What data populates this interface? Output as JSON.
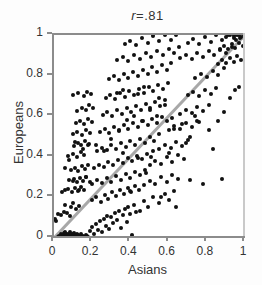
{
  "chart_data": {
    "type": "scatter",
    "correlation_label": "r",
    "correlation_operator": "=",
    "correlation_value": ".81",
    "xlabel": "Asians",
    "ylabel": "Europeans",
    "xlim": [
      0,
      1
    ],
    "ylim": [
      0,
      1
    ],
    "grid": false,
    "legend": null,
    "xticks": [
      "0",
      "0.2",
      "0.4",
      "0.6",
      "0.8",
      "1"
    ],
    "xtick_values": [
      0,
      0.2,
      0.4,
      0.6,
      0.8,
      1
    ],
    "yticks": [
      "0",
      "0.2",
      "0.4",
      "0.6",
      "0.8",
      "1"
    ],
    "ytick_values": [
      0,
      0.2,
      0.4,
      0.6,
      0.8,
      1
    ],
    "reference_line": {
      "name": "identity-line",
      "from": [
        0,
        0
      ],
      "to": [
        1,
        1
      ],
      "color": "#a8a8a8",
      "width": 3
    },
    "marker": {
      "shape": "circle",
      "color": "#111111",
      "size_px": 4
    },
    "axis_color": "#8c8c8c",
    "background": "#ffffff",
    "points": [
      [
        0.005,
        0.095
      ],
      [
        0.012,
        0.085
      ],
      [
        0.02,
        0.005
      ],
      [
        0.025,
        0.012
      ],
      [
        0.03,
        0.002
      ],
      [
        0.035,
        0.02
      ],
      [
        0.04,
        0.008
      ],
      [
        0.042,
        0.0
      ],
      [
        0.045,
        0.015
      ],
      [
        0.05,
        0.005
      ],
      [
        0.052,
        0.025
      ],
      [
        0.055,
        0.0
      ],
      [
        0.058,
        0.01
      ],
      [
        0.06,
        0.03
      ],
      [
        0.062,
        0.005
      ],
      [
        0.065,
        0.018
      ],
      [
        0.068,
        0.0
      ],
      [
        0.07,
        0.008
      ],
      [
        0.072,
        0.022
      ],
      [
        0.075,
        0.002
      ],
      [
        0.078,
        0.012
      ],
      [
        0.08,
        0.0
      ],
      [
        0.082,
        0.028
      ],
      [
        0.085,
        0.006
      ],
      [
        0.088,
        0.015
      ],
      [
        0.09,
        0.0
      ],
      [
        0.092,
        0.01
      ],
      [
        0.095,
        0.02
      ],
      [
        0.098,
        0.004
      ],
      [
        0.1,
        0.013
      ],
      [
        0.103,
        0.0
      ],
      [
        0.105,
        0.026
      ],
      [
        0.108,
        0.008
      ],
      [
        0.11,
        0.017
      ],
      [
        0.112,
        0.0
      ],
      [
        0.115,
        0.01
      ],
      [
        0.118,
        0.022
      ],
      [
        0.12,
        0.003
      ],
      [
        0.125,
        0.014
      ],
      [
        0.13,
        0.0
      ],
      [
        0.135,
        0.009
      ],
      [
        0.14,
        0.019
      ],
      [
        0.145,
        0.002
      ],
      [
        0.15,
        0.012
      ],
      [
        0.155,
        0.0
      ],
      [
        0.16,
        0.007
      ],
      [
        0.165,
        0.016
      ],
      [
        0.17,
        0.0
      ],
      [
        0.175,
        0.011
      ],
      [
        0.18,
        0.004
      ],
      [
        0.02,
        0.118
      ],
      [
        0.035,
        0.115
      ],
      [
        0.05,
        0.13
      ],
      [
        0.07,
        0.125
      ],
      [
        0.085,
        0.108
      ],
      [
        0.06,
        0.165
      ],
      [
        0.09,
        0.155
      ],
      [
        0.1,
        0.17
      ],
      [
        0.115,
        0.145
      ],
      [
        0.13,
        0.158
      ],
      [
        0.04,
        0.225
      ],
      [
        0.055,
        0.235
      ],
      [
        0.075,
        0.24
      ],
      [
        0.095,
        0.228
      ],
      [
        0.11,
        0.245
      ],
      [
        0.125,
        0.232
      ],
      [
        0.14,
        0.25
      ],
      [
        0.155,
        0.238
      ],
      [
        0.08,
        0.285
      ],
      [
        0.105,
        0.29
      ],
      [
        0.12,
        0.275
      ],
      [
        0.135,
        0.295
      ],
      [
        0.15,
        0.282
      ],
      [
        0.165,
        0.3
      ],
      [
        0.09,
        0.335
      ],
      [
        0.112,
        0.345
      ],
      [
        0.128,
        0.33
      ],
      [
        0.145,
        0.355
      ],
      [
        0.16,
        0.34
      ],
      [
        0.178,
        0.36
      ],
      [
        0.075,
        0.405
      ],
      [
        0.098,
        0.415
      ],
      [
        0.118,
        0.4
      ],
      [
        0.14,
        0.425
      ],
      [
        0.158,
        0.41
      ],
      [
        0.105,
        0.455
      ],
      [
        0.125,
        0.47
      ],
      [
        0.142,
        0.46
      ],
      [
        0.162,
        0.478
      ],
      [
        0.182,
        0.465
      ],
      [
        0.1,
        0.51
      ],
      [
        0.122,
        0.52
      ],
      [
        0.148,
        0.505
      ],
      [
        0.168,
        0.53
      ],
      [
        0.188,
        0.515
      ],
      [
        0.115,
        0.565
      ],
      [
        0.138,
        0.578
      ],
      [
        0.158,
        0.56
      ],
      [
        0.178,
        0.585
      ],
      [
        0.198,
        0.57
      ],
      [
        0.12,
        0.625
      ],
      [
        0.145,
        0.64
      ],
      [
        0.165,
        0.63
      ],
      [
        0.185,
        0.655
      ],
      [
        0.205,
        0.638
      ],
      [
        0.1,
        0.705
      ],
      [
        0.128,
        0.715
      ],
      [
        0.155,
        0.7
      ],
      [
        0.175,
        0.72
      ],
      [
        0.195,
        0.71
      ],
      [
        0.19,
        0.035
      ],
      [
        0.2,
        0.055
      ],
      [
        0.21,
        0.02
      ],
      [
        0.22,
        0.07
      ],
      [
        0.23,
        0.04
      ],
      [
        0.24,
        0.085
      ],
      [
        0.25,
        0.03
      ],
      [
        0.26,
        0.095
      ],
      [
        0.27,
        0.06
      ],
      [
        0.28,
        0.11
      ],
      [
        0.29,
        0.045
      ],
      [
        0.3,
        0.105
      ],
      [
        0.31,
        0.075
      ],
      [
        0.32,
        0.125
      ],
      [
        0.33,
        0.09
      ],
      [
        0.34,
        0.135
      ],
      [
        0.35,
        0.05
      ],
      [
        0.36,
        0.115
      ],
      [
        0.37,
        0.145
      ],
      [
        0.38,
        0.08
      ],
      [
        0.39,
        0.155
      ],
      [
        0.4,
        0.12
      ],
      [
        0.41,
        0.015
      ],
      [
        0.42,
        0.165
      ],
      [
        0.43,
        0.13
      ],
      [
        0.2,
        0.185
      ],
      [
        0.22,
        0.2
      ],
      [
        0.245,
        0.175
      ],
      [
        0.265,
        0.21
      ],
      [
        0.285,
        0.19
      ],
      [
        0.305,
        0.225
      ],
      [
        0.325,
        0.205
      ],
      [
        0.345,
        0.235
      ],
      [
        0.365,
        0.215
      ],
      [
        0.385,
        0.245
      ],
      [
        0.405,
        0.225
      ],
      [
        0.425,
        0.255
      ],
      [
        0.445,
        0.235
      ],
      [
        0.2,
        0.265
      ],
      [
        0.225,
        0.285
      ],
      [
        0.25,
        0.27
      ],
      [
        0.275,
        0.295
      ],
      [
        0.3,
        0.278
      ],
      [
        0.325,
        0.305
      ],
      [
        0.35,
        0.288
      ],
      [
        0.375,
        0.315
      ],
      [
        0.4,
        0.298
      ],
      [
        0.425,
        0.325
      ],
      [
        0.45,
        0.308
      ],
      [
        0.475,
        0.335
      ],
      [
        0.21,
        0.345
      ],
      [
        0.235,
        0.36
      ],
      [
        0.26,
        0.348
      ],
      [
        0.285,
        0.375
      ],
      [
        0.31,
        0.358
      ],
      [
        0.335,
        0.385
      ],
      [
        0.36,
        0.368
      ],
      [
        0.385,
        0.395
      ],
      [
        0.41,
        0.378
      ],
      [
        0.435,
        0.405
      ],
      [
        0.46,
        0.388
      ],
      [
        0.485,
        0.415
      ],
      [
        0.51,
        0.398
      ],
      [
        0.225,
        0.43
      ],
      [
        0.25,
        0.445
      ],
      [
        0.275,
        0.435
      ],
      [
        0.3,
        0.46
      ],
      [
        0.325,
        0.44
      ],
      [
        0.35,
        0.47
      ],
      [
        0.375,
        0.45
      ],
      [
        0.4,
        0.48
      ],
      [
        0.425,
        0.458
      ],
      [
        0.45,
        0.49
      ],
      [
        0.475,
        0.468
      ],
      [
        0.5,
        0.5
      ],
      [
        0.525,
        0.478
      ],
      [
        0.55,
        0.51
      ],
      [
        0.24,
        0.52
      ],
      [
        0.265,
        0.535
      ],
      [
        0.29,
        0.515
      ],
      [
        0.315,
        0.545
      ],
      [
        0.34,
        0.525
      ],
      [
        0.365,
        0.555
      ],
      [
        0.39,
        0.535
      ],
      [
        0.415,
        0.565
      ],
      [
        0.44,
        0.545
      ],
      [
        0.465,
        0.575
      ],
      [
        0.49,
        0.555
      ],
      [
        0.515,
        0.585
      ],
      [
        0.54,
        0.565
      ],
      [
        0.565,
        0.595
      ],
      [
        0.255,
        0.605
      ],
      [
        0.28,
        0.62
      ],
      [
        0.305,
        0.6
      ],
      [
        0.33,
        0.63
      ],
      [
        0.355,
        0.61
      ],
      [
        0.38,
        0.64
      ],
      [
        0.405,
        0.62
      ],
      [
        0.43,
        0.65
      ],
      [
        0.455,
        0.63
      ],
      [
        0.48,
        0.66
      ],
      [
        0.505,
        0.64
      ],
      [
        0.53,
        0.67
      ],
      [
        0.555,
        0.65
      ],
      [
        0.58,
        0.68
      ],
      [
        0.27,
        0.69
      ],
      [
        0.295,
        0.705
      ],
      [
        0.32,
        0.685
      ],
      [
        0.345,
        0.715
      ],
      [
        0.37,
        0.695
      ],
      [
        0.395,
        0.725
      ],
      [
        0.42,
        0.705
      ],
      [
        0.445,
        0.735
      ],
      [
        0.47,
        0.715
      ],
      [
        0.495,
        0.745
      ],
      [
        0.52,
        0.725
      ],
      [
        0.545,
        0.755
      ],
      [
        0.57,
        0.735
      ],
      [
        0.595,
        0.765
      ],
      [
        0.29,
        0.785
      ],
      [
        0.315,
        0.8
      ],
      [
        0.34,
        0.78
      ],
      [
        0.365,
        0.81
      ],
      [
        0.39,
        0.79
      ],
      [
        0.415,
        0.82
      ],
      [
        0.44,
        0.8
      ],
      [
        0.465,
        0.83
      ],
      [
        0.49,
        0.81
      ],
      [
        0.515,
        0.84
      ],
      [
        0.54,
        0.82
      ],
      [
        0.565,
        0.85
      ],
      [
        0.59,
        0.83
      ],
      [
        0.615,
        0.86
      ],
      [
        0.33,
        0.875
      ],
      [
        0.36,
        0.89
      ],
      [
        0.39,
        0.87
      ],
      [
        0.42,
        0.9
      ],
      [
        0.45,
        0.88
      ],
      [
        0.48,
        0.91
      ],
      [
        0.51,
        0.89
      ],
      [
        0.54,
        0.92
      ],
      [
        0.57,
        0.9
      ],
      [
        0.6,
        0.93
      ],
      [
        0.63,
        0.91
      ],
      [
        0.655,
        0.94
      ],
      [
        0.37,
        0.955
      ],
      [
        0.4,
        0.97
      ],
      [
        0.43,
        0.95
      ],
      [
        0.46,
        0.985
      ],
      [
        0.49,
        0.96
      ],
      [
        0.52,
        0.995
      ],
      [
        0.55,
        0.97
      ],
      [
        0.58,
        1.0
      ],
      [
        0.61,
        0.975
      ],
      [
        0.64,
        1.0
      ],
      [
        0.45,
        0.135
      ],
      [
        0.47,
        0.18
      ],
      [
        0.49,
        0.155
      ],
      [
        0.52,
        0.2
      ],
      [
        0.55,
        0.17
      ],
      [
        0.58,
        0.215
      ],
      [
        0.6,
        0.185
      ],
      [
        0.63,
        0.23
      ],
      [
        0.47,
        0.26
      ],
      [
        0.5,
        0.28
      ],
      [
        0.53,
        0.265
      ],
      [
        0.56,
        0.3
      ],
      [
        0.59,
        0.275
      ],
      [
        0.62,
        0.31
      ],
      [
        0.65,
        0.29
      ],
      [
        0.5,
        0.36
      ],
      [
        0.53,
        0.38
      ],
      [
        0.56,
        0.365
      ],
      [
        0.59,
        0.4
      ],
      [
        0.62,
        0.375
      ],
      [
        0.65,
        0.41
      ],
      [
        0.68,
        0.39
      ],
      [
        0.55,
        0.44
      ],
      [
        0.58,
        0.46
      ],
      [
        0.61,
        0.445
      ],
      [
        0.64,
        0.475
      ],
      [
        0.67,
        0.455
      ],
      [
        0.7,
        0.485
      ],
      [
        0.6,
        0.53
      ],
      [
        0.63,
        0.55
      ],
      [
        0.66,
        0.535
      ],
      [
        0.69,
        0.565
      ],
      [
        0.72,
        0.545
      ],
      [
        0.75,
        0.575
      ],
      [
        0.66,
        0.61
      ],
      [
        0.69,
        0.63
      ],
      [
        0.72,
        0.615
      ],
      [
        0.75,
        0.645
      ],
      [
        0.78,
        0.625
      ],
      [
        0.81,
        0.655
      ],
      [
        0.7,
        0.705
      ],
      [
        0.73,
        0.72
      ],
      [
        0.76,
        0.7
      ],
      [
        0.79,
        0.73
      ],
      [
        0.82,
        0.71
      ],
      [
        0.85,
        0.74
      ],
      [
        0.74,
        0.79
      ],
      [
        0.77,
        0.81
      ],
      [
        0.8,
        0.795
      ],
      [
        0.83,
        0.825
      ],
      [
        0.86,
        0.805
      ],
      [
        0.89,
        0.835
      ],
      [
        0.66,
        0.885
      ],
      [
        0.69,
        0.9
      ],
      [
        0.72,
        0.88
      ],
      [
        0.75,
        0.91
      ],
      [
        0.78,
        0.89
      ],
      [
        0.81,
        0.92
      ],
      [
        0.84,
        0.9
      ],
      [
        0.87,
        0.93
      ],
      [
        0.9,
        0.91
      ],
      [
        0.93,
        0.94
      ],
      [
        0.7,
        0.96
      ],
      [
        0.73,
        0.98
      ],
      [
        0.76,
        0.955
      ],
      [
        0.79,
        0.99
      ],
      [
        0.82,
        0.965
      ],
      [
        0.85,
        1.0
      ],
      [
        0.88,
        0.975
      ],
      [
        0.91,
        1.0
      ],
      [
        0.94,
        0.985
      ],
      [
        0.97,
        1.0
      ],
      [
        0.86,
        0.855
      ],
      [
        0.88,
        0.875
      ],
      [
        0.9,
        0.86
      ],
      [
        0.92,
        0.885
      ],
      [
        0.94,
        0.865
      ],
      [
        0.96,
        0.895
      ],
      [
        0.98,
        0.875
      ],
      [
        0.87,
        0.925
      ],
      [
        0.89,
        0.945
      ],
      [
        0.91,
        0.93
      ],
      [
        0.93,
        0.955
      ],
      [
        0.95,
        0.935
      ],
      [
        0.97,
        0.96
      ],
      [
        0.99,
        0.945
      ],
      [
        0.9,
        0.99
      ],
      [
        0.92,
        1.0
      ],
      [
        0.94,
        0.995
      ],
      [
        0.96,
        1.0
      ],
      [
        0.98,
        0.99
      ],
      [
        0.995,
        1.0
      ],
      [
        0.955,
        0.975
      ],
      [
        0.975,
        0.985
      ],
      [
        0.71,
        0.285
      ],
      [
        0.78,
        0.265
      ],
      [
        0.83,
        0.44
      ],
      [
        0.86,
        0.575
      ],
      [
        0.89,
        0.62
      ],
      [
        0.92,
        0.69
      ],
      [
        0.95,
        0.73
      ],
      [
        0.97,
        0.745
      ],
      [
        0.88,
        0.29
      ],
      [
        0.81,
        0.53
      ],
      [
        0.74,
        0.6
      ],
      [
        0.69,
        0.47
      ],
      [
        0.64,
        0.155
      ],
      [
        0.6,
        0.42
      ],
      [
        0.56,
        0.2
      ],
      [
        0.52,
        0.43
      ],
      [
        0.48,
        0.32
      ],
      [
        0.44,
        0.395
      ],
      [
        0.4,
        0.23
      ],
      [
        0.36,
        0.42
      ],
      [
        0.15,
        0.44
      ],
      [
        0.18,
        0.46
      ],
      [
        0.11,
        0.475
      ],
      [
        0.08,
        0.385
      ],
      [
        0.06,
        0.345
      ],
      [
        0.13,
        0.235
      ],
      [
        0.1,
        0.28
      ],
      [
        0.17,
        0.3
      ],
      [
        0.19,
        0.275
      ],
      [
        0.22,
        0.46
      ],
      [
        0.26,
        0.43
      ],
      [
        0.3,
        0.49
      ],
      [
        0.34,
        0.53
      ],
      [
        0.38,
        0.58
      ],
      [
        0.42,
        0.6
      ],
      [
        0.46,
        0.575
      ],
      [
        0.5,
        0.63
      ],
      [
        0.54,
        0.6
      ],
      [
        0.58,
        0.655
      ],
      [
        0.62,
        0.59
      ],
      [
        0.33,
        0.715
      ],
      [
        0.36,
        0.73
      ],
      [
        0.44,
        0.71
      ],
      [
        0.47,
        0.745
      ],
      [
        0.55,
        0.69
      ],
      [
        0.59,
        0.575
      ],
      [
        0.63,
        0.535
      ],
      [
        0.67,
        0.56
      ],
      [
        0.71,
        0.5
      ],
      [
        0.76,
        0.57
      ]
    ]
  }
}
